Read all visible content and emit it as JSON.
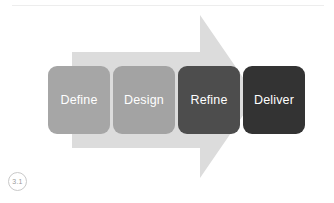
{
  "slide": {
    "background_color": "#ffffff",
    "width": 334,
    "height": 203
  },
  "top_rule": {
    "color": "#ededed"
  },
  "arrow": {
    "name": "process-arrow",
    "direction": "right",
    "fill_color": "#dcdcdc",
    "tail_left": 72,
    "tail_top": 52,
    "tail_bottom": 148,
    "head_top": 15,
    "head_bottom": 178,
    "tip_x": 256
  },
  "diagram": {
    "title": "",
    "steps": [
      {
        "label": "Define",
        "fill_color": "#a6a6a6",
        "text_color": "#ffffff",
        "left": 48,
        "width": 62
      },
      {
        "label": "Design",
        "fill_color": "#a3a3a3",
        "text_color": "#ffffff",
        "left": 113,
        "width": 62
      },
      {
        "label": "Refine",
        "fill_color": "#4d4d4d",
        "text_color": "#ffffff",
        "left": 178,
        "width": 62
      },
      {
        "label": "Deliver",
        "fill_color": "#333333",
        "text_color": "#ffffff",
        "left": 243,
        "width": 62
      }
    ]
  },
  "figure_badge": {
    "text": "3.1",
    "border_color": "#c9c9c9",
    "text_color": "#9b9b9b"
  }
}
